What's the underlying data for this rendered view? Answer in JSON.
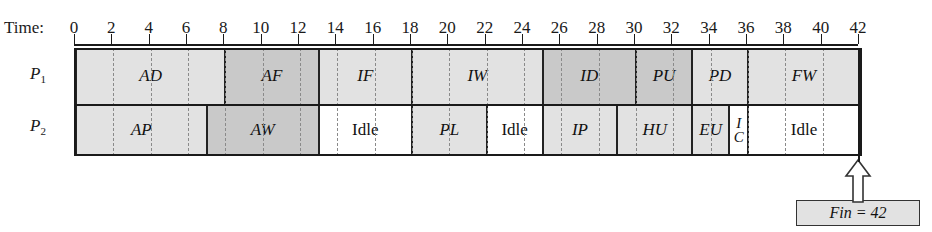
{
  "figure": {
    "axis_label": "Time:",
    "time_min": 0,
    "time_max": 42,
    "tick_step": 2,
    "ticks": [
      0,
      2,
      4,
      6,
      8,
      10,
      12,
      14,
      16,
      18,
      20,
      22,
      24,
      26,
      28,
      30,
      32,
      34,
      36,
      38,
      40,
      42
    ],
    "tick_labels": [
      "0",
      "2",
      "4",
      "6",
      "8",
      "10",
      "12",
      "14",
      "16",
      "18",
      "20",
      "22",
      "24",
      "26",
      "28",
      "30",
      "32",
      "34",
      "36",
      "38",
      "40",
      "42"
    ],
    "colors": {
      "light_gray": "#e2e2e2",
      "dark_gray": "#c9c9c9",
      "white": "#ffffff",
      "line": "#1a1a1a",
      "dashed_grid": "#8a8a8a"
    }
  },
  "rows": [
    {
      "name": "P1",
      "label_text": "P",
      "label_sub": "1",
      "segments": [
        {
          "label": "AD",
          "start": 0,
          "end": 8,
          "shade": "light",
          "italic": true
        },
        {
          "label": "AF",
          "start": 8,
          "end": 13,
          "shade": "dark",
          "italic": true
        },
        {
          "label": "IF",
          "start": 13,
          "end": 18,
          "shade": "light",
          "italic": true
        },
        {
          "label": "IW",
          "start": 18,
          "end": 25,
          "shade": "light",
          "italic": true
        },
        {
          "label": "ID",
          "start": 25,
          "end": 30,
          "shade": "dark",
          "italic": true
        },
        {
          "label": "PU",
          "start": 30,
          "end": 33,
          "shade": "dark",
          "italic": true
        },
        {
          "label": "PD",
          "start": 33,
          "end": 36,
          "shade": "light",
          "italic": true
        },
        {
          "label": "FW",
          "start": 36,
          "end": 42,
          "shade": "light",
          "italic": true
        }
      ]
    },
    {
      "name": "P2",
      "label_text": "P",
      "label_sub": "2",
      "segments": [
        {
          "label": "AP",
          "start": 0,
          "end": 7,
          "shade": "light",
          "italic": true
        },
        {
          "label": "AW",
          "start": 7,
          "end": 13,
          "shade": "dark",
          "italic": true
        },
        {
          "label": "Idle",
          "start": 13,
          "end": 18,
          "shade": "white",
          "italic": false
        },
        {
          "label": "PL",
          "start": 18,
          "end": 22,
          "shade": "light",
          "italic": true
        },
        {
          "label": "Idle",
          "start": 22,
          "end": 25,
          "shade": "white",
          "italic": false
        },
        {
          "label": "IP",
          "start": 25,
          "end": 29,
          "shade": "light",
          "italic": true
        },
        {
          "label": "HU",
          "start": 29,
          "end": 33,
          "shade": "light",
          "italic": true
        },
        {
          "label": "EU",
          "start": 33,
          "end": 35,
          "shade": "light",
          "italic": true
        },
        {
          "label": "I/C",
          "start": 35,
          "end": 36,
          "shade": "white",
          "italic": true,
          "stacked": [
            "I",
            "C"
          ]
        },
        {
          "label": "Idle",
          "start": 36,
          "end": 42,
          "shade": "white",
          "italic": false
        }
      ]
    }
  ],
  "annotation": {
    "fin_text": "Fin = 42",
    "fin_time": 42,
    "arrow": "up-arrow-icon"
  }
}
